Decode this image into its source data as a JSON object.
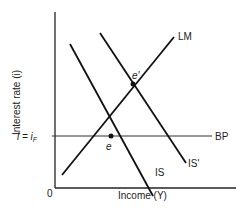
{
  "diagram": {
    "type": "IS-LM-BP",
    "axes": {
      "ylabel": "Interest rate (i)",
      "xlabel": "Income (Y)",
      "origin": "0"
    },
    "curves": {
      "lm": "LM",
      "is": "IS",
      "is_shifted": "IS'",
      "bp": "BP"
    },
    "points": {
      "e": "e",
      "e_prime": "e'"
    },
    "bp_level_label": "i = i",
    "bp_level_sub": "F"
  }
}
